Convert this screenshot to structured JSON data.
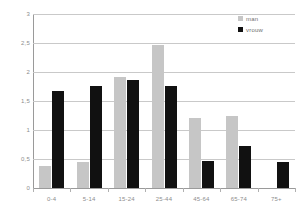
{
  "chart_data": {
    "type": "bar",
    "title": "",
    "subtitle": "",
    "xlabel": "",
    "ylabel": "",
    "categories": [
      "0-4",
      "5-14",
      "15-24",
      "25-44",
      "45-64",
      "65-74",
      "75+"
    ],
    "series": [
      {
        "name": "man",
        "color": "#c6c6c6",
        "values": [
          0.38,
          0.44,
          1.92,
          2.46,
          1.21,
          1.25,
          0
        ]
      },
      {
        "name": "vrouw",
        "color": "#111111",
        "values": [
          1.68,
          1.76,
          1.87,
          1.76,
          0.46,
          0.73,
          0.44
        ]
      }
    ],
    "ylim": [
      0,
      3
    ],
    "yticks": [
      0,
      0.5,
      1,
      1.5,
      2,
      2.5,
      3
    ],
    "ytick_labels": [
      "0",
      "0,5",
      "1",
      "1,5",
      "2",
      "2,5",
      "3"
    ],
    "grid": true,
    "legend_position": "top-right"
  },
  "legend": {
    "items": [
      {
        "label": "man"
      },
      {
        "label": "vrouw"
      }
    ]
  },
  "colors": {
    "series_man": "#c6c6c6",
    "series_vrouw": "#111111",
    "gridline": "#c9c9c9",
    "axis": "#9a9a9a",
    "tick_text": "#8d8d8d",
    "legend_text": "#6f6f6f",
    "background": "#ffffff"
  }
}
